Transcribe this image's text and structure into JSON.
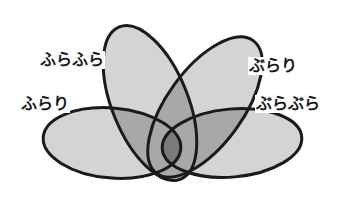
{
  "diagram": {
    "type": "venn-4-ellipse",
    "stroke_color": "#1a1a1a",
    "stroke_width": 3,
    "single_fill": "#d4d4d4",
    "overlap_fill": "#a8a8a8",
    "center_fill": "#7a7a7a",
    "ellipses": [
      {
        "id": "furafura",
        "label": "ふらふら",
        "cx": 150,
        "cy": 103,
        "rx": 38,
        "ry": 82,
        "rotate": -22
      },
      {
        "id": "burari",
        "label": "ぶらり",
        "cx": 205,
        "cy": 107,
        "rx": 38,
        "ry": 82,
        "rotate": 36
      },
      {
        "id": "furari",
        "label": "ふらり",
        "cx": 112,
        "cy": 143,
        "rx": 69,
        "ry": 35,
        "rotate": 5
      },
      {
        "id": "burabura",
        "label": "ぶらぶら",
        "cx": 232,
        "cy": 143,
        "rx": 70,
        "ry": 34,
        "rotate": -5
      }
    ],
    "labels": [
      {
        "text": "ふらふら",
        "x": 39,
        "y": 51
      },
      {
        "text": "ぶらり",
        "x": 248,
        "y": 57
      },
      {
        "text": "ふらり",
        "x": 20,
        "y": 95
      },
      {
        "text": "ぶらぶら",
        "x": 255,
        "y": 95
      }
    ]
  }
}
